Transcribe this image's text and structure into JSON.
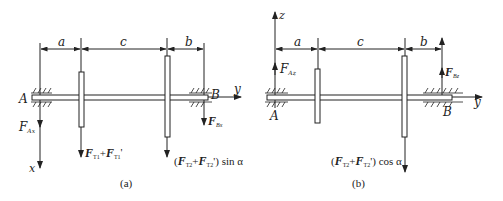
{
  "figure": {
    "panels": [
      {
        "caption": "(a)",
        "axes": {
          "horizontal": "y",
          "vertical": "x"
        },
        "points": {
          "left_bearing": "A",
          "right_bearing": "B"
        },
        "dimensions": {
          "d1": "a",
          "d2": "c",
          "d3": "b"
        },
        "forces": {
          "reaction_A": {
            "main": "F",
            "sub": "Ax"
          },
          "reaction_B": {
            "main": "F",
            "sub": "Bx"
          },
          "gear1_load": {
            "p1": "F",
            "s1": "T1",
            "plus": "+",
            "p2": "F",
            "s2": "T1",
            "prime": "'"
          },
          "gear2_load": {
            "open": "(",
            "p1": "F",
            "s1": "T2",
            "plus": "+",
            "p2": "F",
            "s2": "T2",
            "close": "') sin α"
          }
        }
      },
      {
        "caption": "(b)",
        "axes": {
          "horizontal": "y",
          "vertical": "z"
        },
        "points": {
          "left_bearing": "A",
          "right_bearing": "B"
        },
        "dimensions": {
          "d1": "a",
          "d2": "c",
          "d3": "b"
        },
        "forces": {
          "reaction_A": {
            "main": "F",
            "sub": "Az"
          },
          "reaction_B": {
            "main": "F",
            "sub": "Bz"
          },
          "gear2_load": {
            "open": "(",
            "p1": "F",
            "s1": "T2",
            "plus": "+",
            "p2": "F",
            "s2": "T2",
            "close": "') cos α"
          }
        }
      }
    ]
  }
}
